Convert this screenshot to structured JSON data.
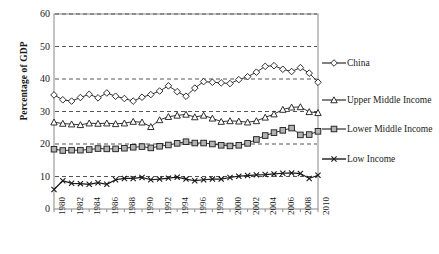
{
  "chart_data": {
    "type": "line",
    "title": "",
    "xlabel": "",
    "ylabel": "Percentage of GDP",
    "ylim": [
      0,
      60
    ],
    "ytick_values": [
      0,
      10,
      20,
      30,
      40,
      50,
      60
    ],
    "ytick_labels": [
      "0",
      "10",
      "20",
      "30",
      "40",
      "50",
      "60"
    ],
    "grid": "horizontal-dashed",
    "legend_position": "right",
    "x": [
      1980,
      1981,
      1982,
      1983,
      1984,
      1985,
      1986,
      1987,
      1988,
      1989,
      1990,
      1991,
      1992,
      1993,
      1994,
      1995,
      1996,
      1997,
      1998,
      1999,
      2000,
      2001,
      2002,
      2003,
      2004,
      2005,
      2006,
      2007,
      2008,
      2009,
      2010
    ],
    "xtick_labels": [
      "1980",
      "1982",
      "1984",
      "1986",
      "1988",
      "1990",
      "1992",
      "1994",
      "1996",
      "1998",
      "2000",
      "2002",
      "2004",
      "2006",
      "2008",
      "2010"
    ],
    "series": [
      {
        "name": "China",
        "marker": "diamond",
        "values": [
          35.1,
          33.6,
          33.2,
          34.3,
          35.3,
          34.2,
          35.7,
          34.7,
          34.0,
          33.2,
          34.4,
          35.2,
          36.3,
          37.9,
          36.1,
          34.7,
          37.2,
          39.2,
          39.0,
          38.8,
          38.6,
          39.8,
          40.7,
          42.1,
          43.9,
          44.1,
          43.0,
          42.3,
          43.5,
          41.8,
          39.0
        ]
      },
      {
        "name": "Upper Middle Income",
        "marker": "triangle",
        "values": [
          26.7,
          26.3,
          26.1,
          25.9,
          26.4,
          26.3,
          26.4,
          26.2,
          26.4,
          26.9,
          26.7,
          25.3,
          27.4,
          28.4,
          28.8,
          29.1,
          28.3,
          28.8,
          27.9,
          26.9,
          27.1,
          27.0,
          26.7,
          27.1,
          28.2,
          29.2,
          30.6,
          31.3,
          31.4,
          29.9,
          29.6
        ]
      },
      {
        "name": "Lower Middle Income",
        "marker": "square",
        "values": [
          18.4,
          18.0,
          18.1,
          18.1,
          18.3,
          18.6,
          18.5,
          18.5,
          18.7,
          19.0,
          19.2,
          18.8,
          19.3,
          19.7,
          20.2,
          20.7,
          20.3,
          20.3,
          20.0,
          19.6,
          19.4,
          19.6,
          20.2,
          21.4,
          22.6,
          23.5,
          24.2,
          24.9,
          22.8,
          22.9,
          23.9
        ]
      },
      {
        "name": "Low Income",
        "marker": "cross",
        "values": [
          6.0,
          8.7,
          7.9,
          7.8,
          7.6,
          8.1,
          7.6,
          9.0,
          9.4,
          9.4,
          9.7,
          9.0,
          9.2,
          9.5,
          9.8,
          9.2,
          8.7,
          9.0,
          9.2,
          9.2,
          9.7,
          10.1,
          10.3,
          10.5,
          10.6,
          10.8,
          11.0,
          11.1,
          10.9,
          9.4,
          10.4
        ]
      }
    ]
  },
  "legend": {
    "items": [
      {
        "label": "China",
        "marker": "diamond-marker"
      },
      {
        "label": "Upper Middle Income",
        "marker": "triangle-marker"
      },
      {
        "label": "Lower Middle Income",
        "marker": "square-marker"
      },
      {
        "label": "Low Income",
        "marker": "cross-marker"
      }
    ]
  },
  "colors": {
    "axis": "#888888",
    "grid": "#555555",
    "line": "#1a1a1a",
    "marker_fill_open": "#ffffff",
    "marker_fill_gray": "#b3b3b3",
    "background": "#ffffff"
  }
}
